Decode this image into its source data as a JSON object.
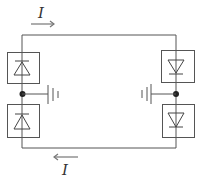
{
  "diagram": {
    "type": "circuit",
    "labels": {
      "top_current": "I",
      "bottom_current": "I"
    },
    "current_direction": {
      "top": "right",
      "bottom": "left"
    },
    "components": {
      "left_top_diode": {
        "orientation": "cathode-up"
      },
      "left_bottom_diode": {
        "orientation": "cathode-up"
      },
      "right_top_diode": {
        "orientation": "cathode-down"
      },
      "right_bottom_diode": {
        "orientation": "cathode-down"
      },
      "left_battery": {
        "plates": 3,
        "side": "left"
      },
      "right_battery": {
        "plates": 3,
        "side": "right"
      }
    },
    "colors": {
      "line": "#555555",
      "junction": "#222222",
      "arrow": "#777777",
      "text": "#333333",
      "background": "#ffffff"
    }
  }
}
